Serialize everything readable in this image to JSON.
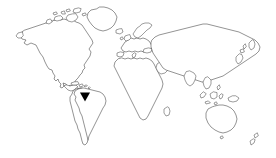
{
  "figure": {
    "type": "world-map-outline",
    "width": 276,
    "height": 158,
    "background_color": "#ffffff",
    "outline_color": "#3a3a3a",
    "outline_width": 0.55,
    "title": "",
    "caption": "",
    "labels_visible": false
  },
  "chart_data": {
    "type": "map",
    "title": "",
    "subtitle": "",
    "xlabel": "",
    "ylabel": "",
    "projection": "equirectangular-stylized",
    "grid": false,
    "legend": false,
    "land_fill": "#ffffff",
    "land_stroke": "#3a3a3a",
    "ocean_fill": "#ffffff",
    "regions": [
      "North America",
      "Greenland",
      "Canadian Arctic Archipelago",
      "Central America",
      "Caribbean Islands",
      "South America",
      "Europe",
      "Scandinavia",
      "British Isles",
      "Africa",
      "Madagascar",
      "Middle East",
      "Asia",
      "India",
      "Southeast Asia",
      "Japan",
      "Indonesian Archipelago",
      "Philippines",
      "Australia",
      "New Zealand"
    ],
    "markers": [
      {
        "name": "location-marker",
        "shape": "triangle-down",
        "color": "#000000",
        "x": 85,
        "y": 97,
        "width": 10,
        "height": 9,
        "region": "northern South America",
        "label": ""
      }
    ]
  },
  "marker": {
    "shape_name": "triangle-down-marker-icon",
    "color": "#000000",
    "region": "northern South America"
  }
}
